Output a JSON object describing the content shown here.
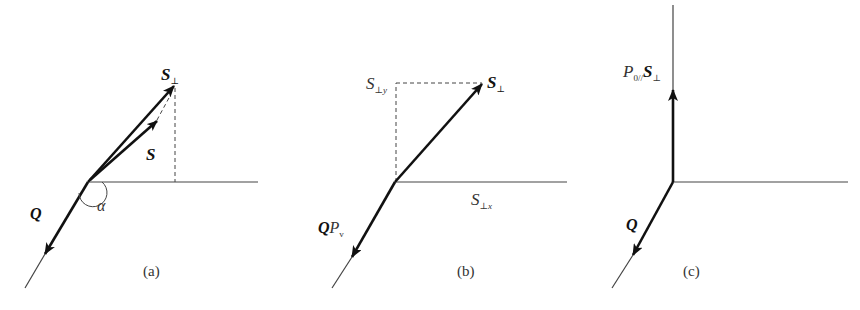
{
  "figure": {
    "panels": [
      {
        "id": "a",
        "caption": "(a)",
        "labels": {
          "s_perp_main": "S",
          "s_perp_sub": "⊥",
          "s": "S",
          "q": "Q",
          "alpha": "α"
        }
      },
      {
        "id": "b",
        "caption": "(b)",
        "labels": {
          "s_perp_main": "S",
          "s_perp_sub": "⊥",
          "s_perp_y_main": "S",
          "s_perp_y_sub": "⊥y",
          "s_perp_x_main": "S",
          "s_perp_x_sub": "⊥x",
          "q": "Q",
          "p_main": "P",
          "p_sub": "v"
        }
      },
      {
        "id": "c",
        "caption": "(c)",
        "labels": {
          "p_main": "P",
          "p_sub": "0//",
          "s_perp_main": "S",
          "s_perp_sub": "⊥",
          "q": "Q"
        }
      }
    ],
    "colors": {
      "stroke": "#111111",
      "thin_stroke": "#444444",
      "text": "#333333"
    }
  }
}
